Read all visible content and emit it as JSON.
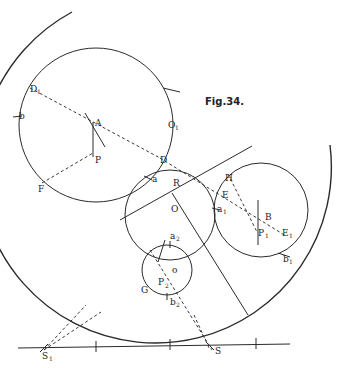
{
  "figure": {
    "title": "Fig.34.",
    "labels": {
      "A": "A",
      "P": "P",
      "D1": "D",
      "D1_sub": "1",
      "b": "b",
      "O1": "O",
      "O1_sub": "1",
      "F": "F",
      "D": "D",
      "a": "a",
      "R": "R",
      "O": "O",
      "H": "H",
      "E": "E",
      "a1": "a",
      "a1_sub": "1",
      "B": "B",
      "P1": "P",
      "P1_sub": "1",
      "E1": "E",
      "E1_sub": "1",
      "b1": "b",
      "b1_sub": "1",
      "a2": "a",
      "a2_sub": "2",
      "o": "o",
      "P2": "P",
      "P2_sub": "2",
      "G": "G",
      "b2": "b",
      "b2_sub": "2",
      "S1": "S",
      "S1_sub": "1",
      "S": "S"
    },
    "colors": {
      "ink": "#2a2a2a",
      "background": "#ffffff"
    }
  }
}
